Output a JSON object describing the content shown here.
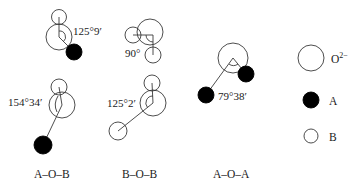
{
  "diagrams": [
    {
      "id": "aob-top",
      "angle": "125°9′"
    },
    {
      "id": "bob-top",
      "angle": "90°"
    },
    {
      "id": "aob-bottom",
      "angle": "154°34′"
    },
    {
      "id": "bob-bottom",
      "angle": "125°2′"
    },
    {
      "id": "aoa",
      "angle": "79°38′"
    }
  ],
  "columns": [
    {
      "label": "A–O–B"
    },
    {
      "label": "B–O–B"
    },
    {
      "label": "A–O–A"
    }
  ],
  "legend": [
    {
      "symbol": "large-open-circle",
      "label": "O",
      "superscript": "2−"
    },
    {
      "symbol": "filled-circle",
      "label": "A"
    },
    {
      "symbol": "small-open-circle",
      "label": "B"
    }
  ],
  "colors": {
    "stroke": "#3a3a3a",
    "fill_a": "#000000",
    "background": "#ffffff"
  }
}
